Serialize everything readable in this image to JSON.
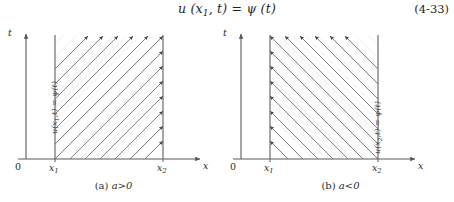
{
  "equation": {
    "text": "u (x1, t) = ψ (t)",
    "function_name": "u",
    "arg_space": "x1",
    "arg_time": "t",
    "rhs": "ψ (t)",
    "number": "(4-33)"
  },
  "figures": [
    {
      "id": "figure-a",
      "caption_index": "(a)",
      "caption_condition": "a>0",
      "caption_full": "(a)  a>0",
      "axes": {
        "y_label": "t",
        "x_label": "x",
        "origin_label": "0",
        "x_ticks": [
          "x1",
          "x2"
        ],
        "x_tick_labels": [
          "x",
          "x"
        ],
        "x_tick_subscripts": [
          "1",
          "2"
        ]
      },
      "boundary_label": {
        "text": "u(x1,t) = ψ(t)",
        "at": "x1",
        "orientation": "vertical"
      },
      "characteristics": {
        "direction": "up-right",
        "slope_degrees": 45,
        "arrow_count": 9,
        "description": "characteristic lines with arrowheads pointing up and to the right"
      },
      "region": {
        "fill": "hatched",
        "from": "x1",
        "to": "x2"
      }
    },
    {
      "id": "figure-b",
      "caption_index": "(b)",
      "caption_condition": "a<0",
      "caption_full": "(b)  a<0",
      "axes": {
        "y_label": "t",
        "x_label": "x",
        "origin_label": "0",
        "x_ticks": [
          "x1",
          "x2"
        ],
        "x_tick_labels": [
          "x",
          "x"
        ],
        "x_tick_subscripts": [
          "1",
          "2"
        ]
      },
      "boundary_label": {
        "text": "u(x2,t) = ψ(t)",
        "at": "x2",
        "orientation": "vertical"
      },
      "characteristics": {
        "direction": "up-left",
        "slope_degrees": 135,
        "arrow_count": 9,
        "description": "characteristic lines with arrowheads pointing up and to the left"
      },
      "region": {
        "fill": "hatched",
        "from": "x1",
        "to": "x2"
      }
    }
  ],
  "colors": {
    "ink": "#2b2b2b",
    "axis": "#5a5a5a",
    "boundary_line": "#6e6e6e",
    "characteristic": "#6a6a6a",
    "background": "#ffffff"
  }
}
